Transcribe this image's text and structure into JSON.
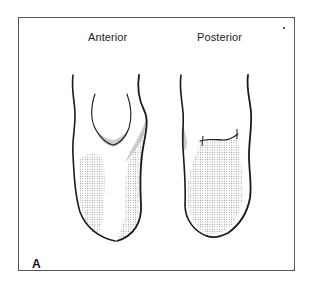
{
  "figure": {
    "panel_label": "A",
    "views": [
      {
        "id": "anterior",
        "label": "Anterior"
      },
      {
        "id": "posterior",
        "label": "Posterior"
      }
    ],
    "colors": {
      "outline": "#1a1a1a",
      "stipple": "#9a9a9a",
      "frame": "#555555",
      "background": "#ffffff"
    }
  }
}
